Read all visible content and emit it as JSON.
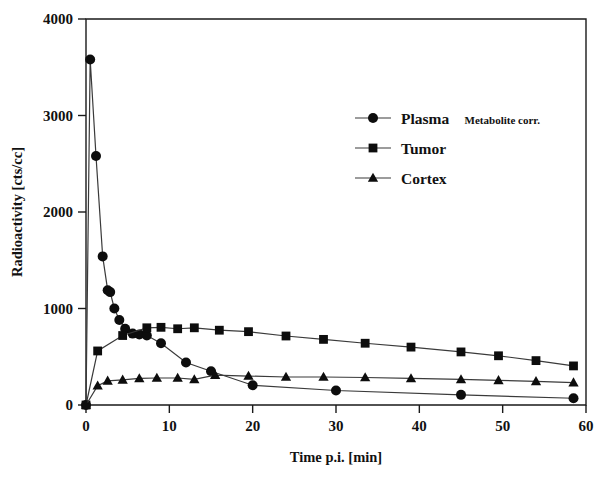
{
  "chart_data": {
    "type": "line",
    "title": "",
    "xlabel": "Time p.i. [min]",
    "ylabel": "Radioactivity [cts/cc]",
    "xlim": [
      0,
      60
    ],
    "ylim": [
      0,
      4000
    ],
    "xticks": [
      0,
      10,
      20,
      30,
      40,
      50,
      60
    ],
    "yticks": [
      0,
      1000,
      2000,
      3000,
      4000
    ],
    "xtick_labels": [
      "0",
      "10",
      "20",
      "30",
      "40",
      "50",
      "60"
    ],
    "ytick_labels": [
      "0",
      "1000",
      "2000",
      "3000",
      "4000"
    ],
    "grid": false,
    "legend_position": "upper-center-right",
    "series": [
      {
        "name": "Plasma",
        "sublabel": "Metabolite corr.",
        "marker": "circle",
        "color": "#0d0d0d",
        "points": [
          {
            "x": 0.0,
            "y": 0
          },
          {
            "x": 0.5,
            "y": 3580
          },
          {
            "x": 1.2,
            "y": 2580
          },
          {
            "x": 2.0,
            "y": 1540
          },
          {
            "x": 2.6,
            "y": 1190
          },
          {
            "x": 2.9,
            "y": 1170
          },
          {
            "x": 3.4,
            "y": 1000
          },
          {
            "x": 4.0,
            "y": 880
          },
          {
            "x": 4.7,
            "y": 790
          },
          {
            "x": 5.6,
            "y": 740
          },
          {
            "x": 6.4,
            "y": 730
          },
          {
            "x": 7.3,
            "y": 720
          },
          {
            "x": 9.0,
            "y": 640
          },
          {
            "x": 12.0,
            "y": 440
          },
          {
            "x": 15.0,
            "y": 350
          },
          {
            "x": 20.0,
            "y": 205
          },
          {
            "x": 30.0,
            "y": 150
          },
          {
            "x": 45.0,
            "y": 105
          },
          {
            "x": 58.5,
            "y": 70
          }
        ]
      },
      {
        "name": "Tumor",
        "sublabel": "",
        "marker": "square",
        "color": "#0d0d0d",
        "points": [
          {
            "x": 0.0,
            "y": 0
          },
          {
            "x": 1.4,
            "y": 560
          },
          {
            "x": 4.4,
            "y": 720
          },
          {
            "x": 7.3,
            "y": 800
          },
          {
            "x": 9.0,
            "y": 805
          },
          {
            "x": 11.0,
            "y": 790
          },
          {
            "x": 13.0,
            "y": 800
          },
          {
            "x": 16.0,
            "y": 775
          },
          {
            "x": 19.5,
            "y": 760
          },
          {
            "x": 24.0,
            "y": 715
          },
          {
            "x": 28.5,
            "y": 680
          },
          {
            "x": 33.5,
            "y": 640
          },
          {
            "x": 39.0,
            "y": 600
          },
          {
            "x": 45.0,
            "y": 550
          },
          {
            "x": 49.5,
            "y": 510
          },
          {
            "x": 54.0,
            "y": 460
          },
          {
            "x": 58.5,
            "y": 405
          }
        ]
      },
      {
        "name": "Cortex",
        "sublabel": "",
        "marker": "triangle",
        "color": "#0d0d0d",
        "points": [
          {
            "x": 0.0,
            "y": 0
          },
          {
            "x": 1.4,
            "y": 200
          },
          {
            "x": 2.6,
            "y": 250
          },
          {
            "x": 4.4,
            "y": 260
          },
          {
            "x": 6.4,
            "y": 275
          },
          {
            "x": 8.5,
            "y": 280
          },
          {
            "x": 11.0,
            "y": 280
          },
          {
            "x": 13.0,
            "y": 265
          },
          {
            "x": 15.5,
            "y": 310
          },
          {
            "x": 19.5,
            "y": 300
          },
          {
            "x": 24.0,
            "y": 290
          },
          {
            "x": 28.5,
            "y": 290
          },
          {
            "x": 33.5,
            "y": 285
          },
          {
            "x": 39.0,
            "y": 275
          },
          {
            "x": 45.0,
            "y": 265
          },
          {
            "x": 49.5,
            "y": 255
          },
          {
            "x": 54.0,
            "y": 245
          },
          {
            "x": 58.5,
            "y": 232
          }
        ]
      }
    ]
  },
  "legend": {
    "entries": [
      {
        "label": "Plasma",
        "sublabel": "Metabolite corr.",
        "marker": "circle"
      },
      {
        "label": "Tumor",
        "sublabel": "",
        "marker": "square"
      },
      {
        "label": "Cortex",
        "sublabel": "",
        "marker": "triangle"
      }
    ]
  }
}
